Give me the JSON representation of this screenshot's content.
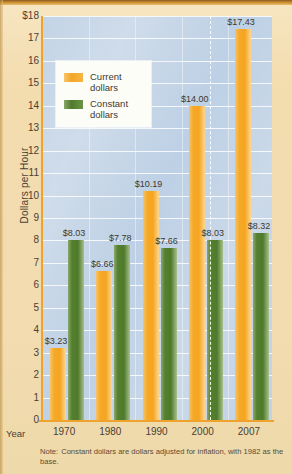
{
  "chart_data": {
    "type": "bar",
    "title": "",
    "xlabel": "Year",
    "ylabel": "Dollars per Hour",
    "categories": [
      "1970",
      "1980",
      "1990",
      "2000",
      "2007"
    ],
    "series": [
      {
        "name": "Current dollars",
        "color": "#f5a928",
        "values": [
          3.23,
          6.66,
          10.19,
          14.0,
          17.43
        ],
        "labels": [
          "$3.23",
          "$6.66",
          "$10.19",
          "$14.00",
          "$17.43"
        ]
      },
      {
        "name": "Constant dollars",
        "color": "#4e7a2b",
        "values": [
          8.03,
          7.78,
          7.66,
          8.03,
          8.32
        ],
        "labels": [
          "$8.03",
          "$7.78",
          "$7.66",
          "$8.03",
          "$8.32"
        ]
      }
    ],
    "ylim": [
      0,
      18
    ],
    "yticks": [
      0,
      1,
      2,
      3,
      4,
      5,
      6,
      7,
      8,
      9,
      10,
      11,
      12,
      13,
      14,
      15,
      16,
      17,
      18
    ],
    "ytick_labels": [
      "0",
      "1",
      "2",
      "3",
      "4",
      "5",
      "6",
      "7",
      "8",
      "9",
      "10",
      "11",
      "12",
      "13",
      "14",
      "15",
      "16",
      "17",
      "$18"
    ],
    "grid": true,
    "legend_position": "upper-left",
    "annotations": [
      "dashed vertical separator before 2007"
    ]
  },
  "axes": {
    "y_title": "Dollars per Hour",
    "x_title": "Year"
  },
  "legend": {
    "items": [
      {
        "label_line1": "Current",
        "label_line2": "dollars",
        "swatch": "current"
      },
      {
        "label_line1": "Constant",
        "label_line2": "dollars",
        "swatch": "constant"
      }
    ]
  },
  "note": {
    "lead": "Note:",
    "text": "Constant dollars are dollars adjusted for inflation, with 1982 as the base."
  },
  "colors": {
    "current_dollars": "#f5a928",
    "constant_dollars": "#4e7a2b",
    "plot_background": "#c3d4e6",
    "page_background": "#f3dcae",
    "axis": "#f0a32c"
  }
}
